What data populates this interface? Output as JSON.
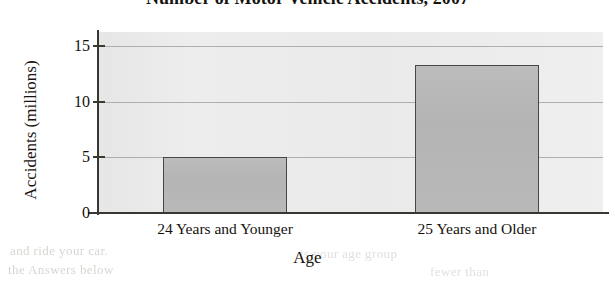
{
  "chart_data": {
    "type": "bar",
    "title": "Number of Motor Vehicle Accidents, 2007",
    "xlabel": "Age",
    "ylabel": "Accidents (millions)",
    "categories": [
      "24 Years and Younger",
      "25 Years and Older"
    ],
    "values": [
      5.0,
      13.3
    ],
    "ylim": [
      0,
      16.3
    ],
    "yticks": [
      0,
      5,
      10,
      15
    ],
    "ytick_labels": [
      "0",
      "5",
      "10",
      "15"
    ],
    "grid": "horizontal",
    "legend": "none",
    "series": [
      {
        "name": "Accidents (millions)",
        "values": [
          5.0,
          13.3
        ]
      }
    ],
    "colors": {
      "bar_fill": "#b7b7b7",
      "bar_border": "#4a4743",
      "plot_background": "#ebebeb",
      "gridline": "#aeaeae",
      "axis": "#3a3733",
      "text": "#14110d",
      "page_background": "#ffffff"
    }
  },
  "artifacts": {
    "ghost_text": [
      "and ride your car.",
      "the Answers below",
      "is your age group",
      "fewer than"
    ]
  }
}
